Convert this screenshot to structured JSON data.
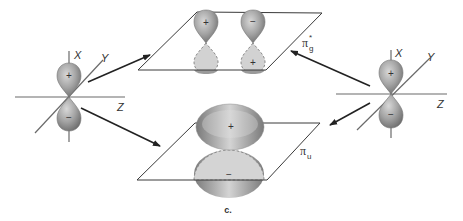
{
  "figure": {
    "caption": "c."
  },
  "left_atom": {
    "axes": {
      "x": "X",
      "y": "Y",
      "z": "Z"
    },
    "upper_lobe_sign": "+",
    "lower_lobe_sign": "−"
  },
  "right_atom": {
    "axes": {
      "x": "X",
      "y": "Y",
      "z": "Z"
    },
    "upper_lobe_sign": "+",
    "lower_lobe_sign": "−"
  },
  "antibonding_mo": {
    "label": "π",
    "subscript": "g",
    "superscript": "*",
    "left_upper_sign": "+",
    "right_upper_sign": "−",
    "right_lower_sign": "+"
  },
  "bonding_mo": {
    "label": "π",
    "subscript": "u",
    "upper_sign": "+",
    "lower_sign": "−"
  },
  "colors": {
    "lobe_dark": "#7d7d7d",
    "lobe_light": "#d8d8d8",
    "lobe_hidden": "#d0d0d0",
    "line": "#333333"
  }
}
